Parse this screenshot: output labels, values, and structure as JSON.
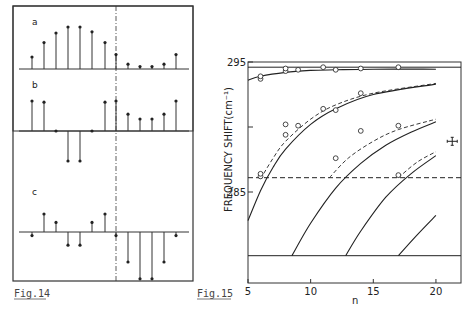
{
  "figures": {
    "fig14": {
      "caption": "Fig.14",
      "panels": [
        {
          "label": "a",
          "baseline": 0,
          "values": [
            1.0,
            2.2,
            3.0,
            3.5,
            3.5,
            3.1,
            2.2,
            1.2,
            0.4,
            0.2,
            0.2,
            0.4,
            1.2
          ]
        },
        {
          "label": "b",
          "baseline": 0,
          "values": [
            2.5,
            2.4,
            0.0,
            -2.5,
            -2.5,
            0.0,
            2.4,
            2.5,
            1.4,
            1.0,
            1.0,
            1.4,
            2.5
          ]
        },
        {
          "label": "c",
          "baseline": 0,
          "values": [
            -0.3,
            1.5,
            0.8,
            -1.1,
            -1.1,
            0.8,
            1.5,
            -0.3,
            -2.5,
            -3.9,
            -3.9,
            -2.5,
            -0.3
          ]
        }
      ],
      "divider_after_index": 7
    },
    "fig15": {
      "caption": "Fig.15"
    }
  },
  "chart_data": {
    "type": "line",
    "title": "",
    "xlabel": "n",
    "ylabel": "FREQUENCY SHIFT(cm⁻¹)",
    "xlim": [
      5,
      22
    ],
    "ylim": [
      278,
      295
    ],
    "x_ticks": [
      "5",
      "10",
      "15",
      "20"
    ],
    "y_ticks": [
      "285",
      "295"
    ],
    "y_tick_values": [
      285,
      290,
      295
    ],
    "grid": false,
    "reference_lines": [
      {
        "style": "solid",
        "y": 294.6
      },
      {
        "style": "dashed",
        "y": 286.1
      },
      {
        "style": "solid",
        "y": 280.1
      }
    ],
    "series": [
      {
        "name": "branch1-solid",
        "style": "solid",
        "points": [
          [
            5,
            293.6
          ],
          [
            6,
            293.9
          ],
          [
            8,
            294.2
          ],
          [
            10,
            294.35
          ],
          [
            12,
            294.4
          ],
          [
            15,
            294.45
          ],
          [
            20,
            294.45
          ]
        ]
      },
      {
        "name": "branch2-solid",
        "style": "solid",
        "points": [
          [
            5,
            282.8
          ],
          [
            6,
            285.1
          ],
          [
            7,
            286.9
          ],
          [
            8,
            288.3
          ],
          [
            10,
            290.2
          ],
          [
            12,
            291.4
          ],
          [
            15,
            292.5
          ],
          [
            20,
            293.3
          ]
        ]
      },
      {
        "name": "branch2-dashed",
        "style": "dashed",
        "points": [
          [
            6,
            286.0
          ],
          [
            7,
            287.6
          ],
          [
            8,
            288.9
          ],
          [
            10,
            290.6
          ],
          [
            12,
            291.7
          ],
          [
            15,
            292.6
          ],
          [
            20,
            293.35
          ]
        ]
      },
      {
        "name": "branch3-solid",
        "style": "solid",
        "points": [
          [
            8.5,
            280.1
          ],
          [
            10,
            282.6
          ],
          [
            12,
            285.3
          ],
          [
            14,
            287.2
          ],
          [
            16,
            288.6
          ],
          [
            18,
            289.6
          ],
          [
            20,
            290.4
          ]
        ]
      },
      {
        "name": "branch3-dashed",
        "style": "dashed",
        "points": [
          [
            11.5,
            286.1
          ],
          [
            13,
            287.6
          ],
          [
            15,
            288.9
          ],
          [
            17,
            289.8
          ],
          [
            20,
            290.6
          ]
        ]
      },
      {
        "name": "branch4-solid",
        "style": "solid",
        "points": [
          [
            12.8,
            280.1
          ],
          [
            14,
            282.0
          ],
          [
            16,
            284.6
          ],
          [
            18,
            286.4
          ],
          [
            20,
            287.8
          ]
        ]
      },
      {
        "name": "branch4-dashed",
        "style": "dashed",
        "points": [
          [
            17,
            286.1
          ],
          [
            18.5,
            287.3
          ],
          [
            20,
            288.1
          ]
        ]
      },
      {
        "name": "branch5-solid",
        "style": "solid",
        "points": [
          [
            17,
            280.1
          ],
          [
            18.5,
            281.7
          ],
          [
            20,
            283.2
          ]
        ]
      }
    ],
    "measured_points": [
      [
        6,
        293.7
      ],
      [
        6,
        293.9
      ],
      [
        8,
        294.3
      ],
      [
        8,
        294.5
      ],
      [
        9,
        294.4
      ],
      [
        11,
        294.6
      ],
      [
        12,
        294.4
      ],
      [
        14,
        294.5
      ],
      [
        17,
        294.6
      ],
      [
        8,
        290.2
      ],
      [
        8,
        289.4
      ],
      [
        9,
        290.1
      ],
      [
        11,
        291.4
      ],
      [
        12,
        291.3
      ],
      [
        14,
        292.6
      ],
      [
        6,
        286.2
      ],
      [
        6,
        286.4
      ],
      [
        12,
        287.6
      ],
      [
        14,
        289.7
      ],
      [
        17,
        290.1
      ],
      [
        17,
        286.3
      ]
    ],
    "error_bar": {
      "x": 21.3,
      "y": 288.9
    }
  }
}
